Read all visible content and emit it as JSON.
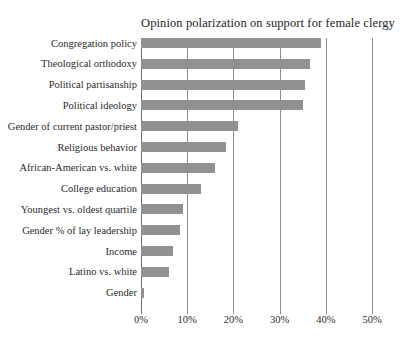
{
  "chart_data": {
    "type": "bar",
    "orientation": "horizontal",
    "title": "Opinion polarization on support for female clergy",
    "xlabel": "",
    "ylabel": "",
    "xlim": [
      0,
      50
    ],
    "xticks": [
      0,
      10,
      20,
      30,
      40,
      50
    ],
    "xtick_labels": [
      "0%",
      "10%",
      "20%",
      "30%",
      "40%",
      "50%"
    ],
    "grid": "vertical",
    "legend": "none",
    "bar_color": "#919191",
    "categories": [
      "Congregation policy",
      "Theological orthodoxy",
      "Political partisanship",
      "Political ideology",
      "Gender of current pastor/priest",
      "Religious behavior",
      "African-American vs. white",
      "College education",
      "Youngest vs. oldest quartile",
      "Gender % of lay leadership",
      "Income",
      "Latino vs. white",
      "Gender"
    ],
    "values": [
      39,
      36.5,
      35.5,
      35,
      21,
      18.5,
      16,
      13,
      9,
      8.5,
      7,
      6,
      0.6
    ]
  },
  "axes": {
    "x_tick_labels": [
      "0%",
      "10%",
      "20%",
      "30%",
      "40%",
      "50%"
    ]
  }
}
